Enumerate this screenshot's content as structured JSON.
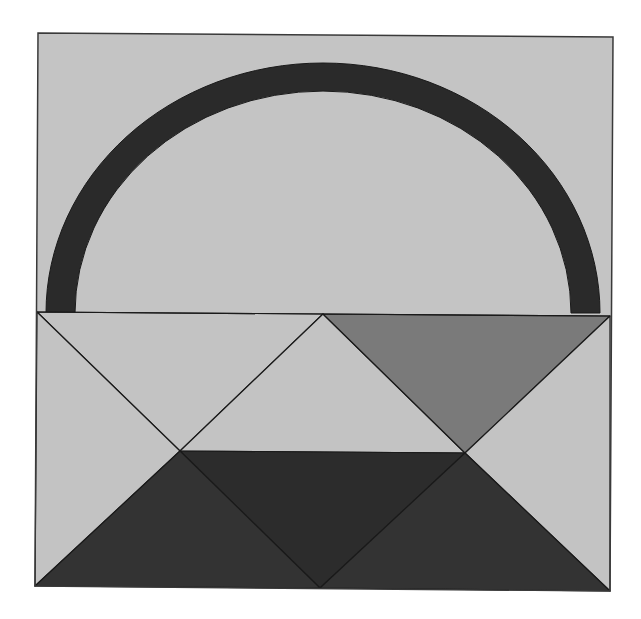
{
  "diagram": {
    "colors": {
      "background": "#c4c4c4",
      "light_patch": "#c3c3c3",
      "medium_patch": "#7a7a7a",
      "dark_center": "#2c2c2c",
      "dark_bottom": "#333333",
      "handle": "#2a2a2a",
      "seam": "#1a1a1a",
      "border": "#3a3a3a"
    },
    "frame": {
      "top_left": [
        38,
        33
      ],
      "top_right": [
        613,
        37
      ],
      "bottom_right": [
        610,
        591
      ],
      "bottom_left": [
        35,
        586
      ]
    },
    "handle": {
      "shape": "semi-elliptical arch",
      "center": [
        323,
        313
      ],
      "outer_radii": [
        277,
        250
      ],
      "inner_radii": [
        248,
        222
      ]
    },
    "basket": {
      "rim_left": [
        37,
        312
      ],
      "rim_center": [
        323,
        314
      ],
      "rim_right": [
        610,
        316
      ],
      "cross_left": [
        180,
        451
      ],
      "cross_right": [
        465,
        453
      ],
      "bottom_center": [
        320,
        588
      ],
      "bottom_left": [
        35,
        586
      ],
      "bottom_right": [
        610,
        591
      ]
    },
    "pieces": [
      {
        "name": "top-left-triangle",
        "fill": "light"
      },
      {
        "name": "left-side-triangle",
        "fill": "light"
      },
      {
        "name": "center-top-triangle",
        "fill": "light"
      },
      {
        "name": "top-right-triangle",
        "fill": "medium"
      },
      {
        "name": "right-side-triangle",
        "fill": "light"
      },
      {
        "name": "center-inverted-triangle",
        "fill": "dark"
      },
      {
        "name": "bottom-left-triangle",
        "fill": "dark"
      },
      {
        "name": "bottom-right-triangle",
        "fill": "dark"
      }
    ]
  }
}
